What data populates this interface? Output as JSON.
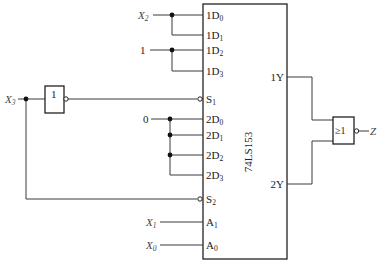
{
  "diagram": {
    "chip": {
      "name": "74LS153",
      "pins_left": [
        {
          "label": "1D",
          "sub": "0"
        },
        {
          "label": "1D",
          "sub": "1"
        },
        {
          "label": "1D",
          "sub": "2"
        },
        {
          "label": "1D",
          "sub": "3"
        },
        {
          "label": "S",
          "sub": "1"
        },
        {
          "label": "2D",
          "sub": "0"
        },
        {
          "label": "2D",
          "sub": "1"
        },
        {
          "label": "2D",
          "sub": "2"
        },
        {
          "label": "2D",
          "sub": "3"
        },
        {
          "label": "S",
          "sub": "2"
        },
        {
          "label": "A",
          "sub": "1"
        },
        {
          "label": "A",
          "sub": "0"
        }
      ],
      "pins_right": [
        {
          "label": "1Y"
        },
        {
          "label": "2Y"
        }
      ]
    },
    "inputs": {
      "x2": {
        "label": "X",
        "sub": "2"
      },
      "x3": {
        "label": "X",
        "sub": "3"
      },
      "x1": {
        "label": "X",
        "sub": "1"
      },
      "x0": {
        "label": "X",
        "sub": "0"
      },
      "const_one": "1",
      "const_zero": "0"
    },
    "not_gate": {
      "symbol": "1"
    },
    "nor_gate": {
      "symbol": "≥1"
    },
    "output": {
      "label": "Z"
    }
  }
}
